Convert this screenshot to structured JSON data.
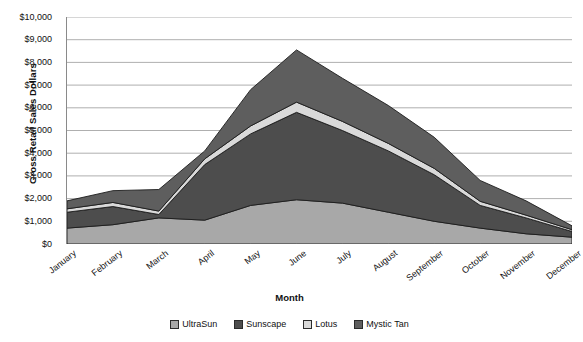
{
  "chart_data": {
    "type": "area",
    "stacked": true,
    "title": "",
    "xlabel": "Month",
    "ylabel": "Gross Retail Sales Dollars",
    "categories": [
      "January",
      "February",
      "March",
      "April",
      "May",
      "June",
      "July",
      "August",
      "September",
      "October",
      "November",
      "December"
    ],
    "ylim": [
      0,
      10000
    ],
    "ytick_labels": [
      "$10,000",
      "$9,000",
      "$8,000",
      "$7,000",
      "$6,000",
      "$5,000",
      "$4,000",
      "$3,000",
      "$2,000",
      "$1,000",
      "$0"
    ],
    "ytick_values": [
      10000,
      9000,
      8000,
      7000,
      6000,
      5000,
      4000,
      3000,
      2000,
      1000,
      0
    ],
    "grid": true,
    "legend_position": "bottom",
    "series": [
      {
        "name": "UltraSun",
        "color": "#a8a8a8",
        "values": [
          700,
          850,
          1150,
          1050,
          1700,
          1950,
          1800,
          1400,
          1000,
          700,
          450,
          300
        ]
      },
      {
        "name": "Sunscape",
        "color": "#4d4d4d",
        "values": [
          700,
          800,
          150,
          2450,
          3150,
          3850,
          3200,
          2700,
          2050,
          1000,
          700,
          250
        ]
      },
      {
        "name": "Lotus",
        "color": "#d9d9d9",
        "values": [
          150,
          180,
          150,
          250,
          350,
          450,
          400,
          330,
          280,
          180,
          120,
          80
        ]
      },
      {
        "name": "Mystic Tan",
        "color": "#5e5e5e",
        "values": [
          350,
          520,
          950,
          350,
          1600,
          2300,
          1900,
          1670,
          1370,
          920,
          630,
          170
        ]
      }
    ],
    "totals": [
      1900,
      2350,
      2400,
      4100,
      6800,
      8550,
      7300,
      6100,
      4700,
      2800,
      1900,
      800
    ]
  },
  "legend": {
    "items": [
      {
        "label": "UltraSun"
      },
      {
        "label": "Sunscape"
      },
      {
        "label": "Lotus"
      },
      {
        "label": "Mystic Tan"
      }
    ]
  }
}
